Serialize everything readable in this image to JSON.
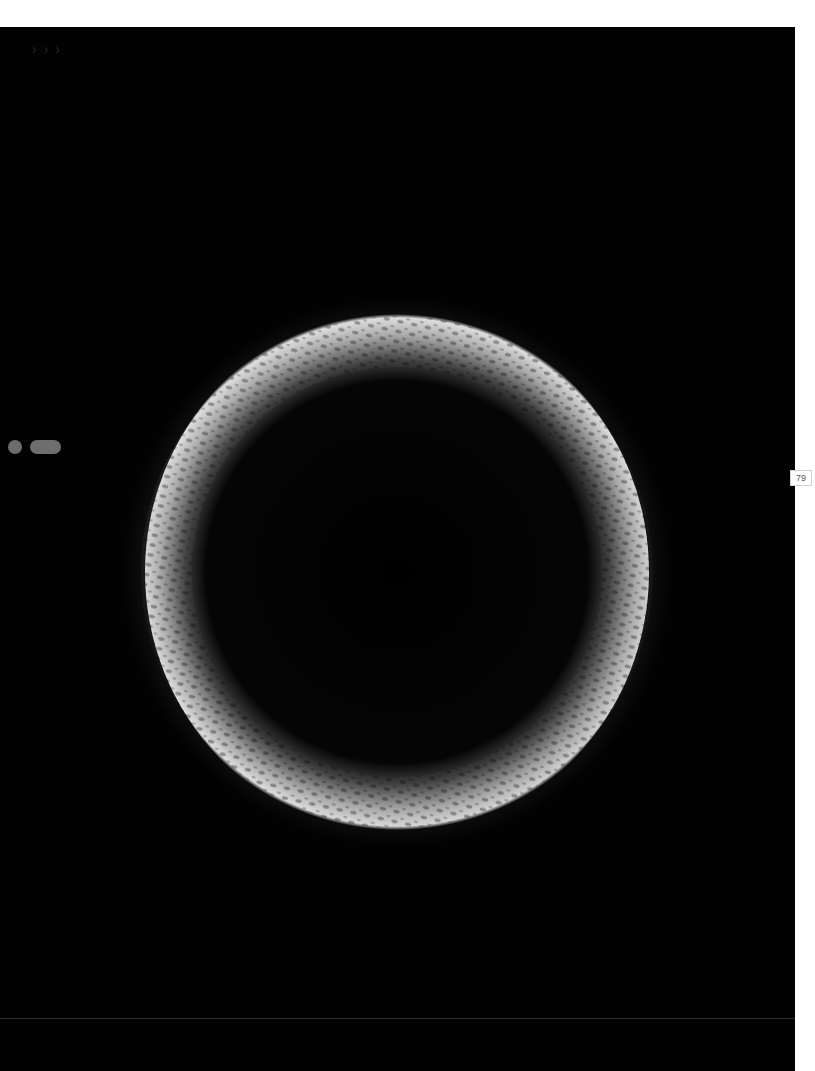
{
  "page": {
    "background": "#ffffff",
    "plate_color": "#020202",
    "page_number": "79"
  },
  "controls": {
    "nav_arrows": [
      "›",
      "›",
      "›"
    ],
    "indicator_dot_color": "#6c6c6c",
    "indicator_pill_color": "#6e6e6e"
  },
  "image": {
    "subject": "textured ring-shaped particle (SEM micrograph)",
    "ring_center": [
      397,
      545
    ],
    "outer_radius": 255,
    "inner_radius": 200,
    "highlight_color": "#d8d8d8",
    "shadow_color": "#1a1a1a"
  }
}
